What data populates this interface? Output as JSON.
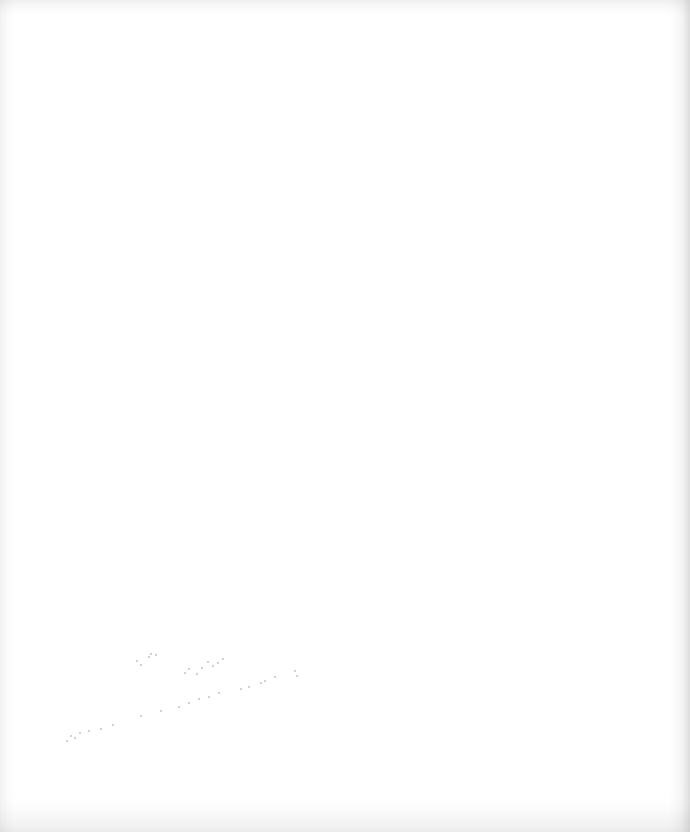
{
  "document": {
    "type": "blank-scanned-page",
    "background_color": "#ffffff",
    "edge_shade_color": "#e6e6e6",
    "speckle_color": "#9a9a9a",
    "visible_text": []
  }
}
